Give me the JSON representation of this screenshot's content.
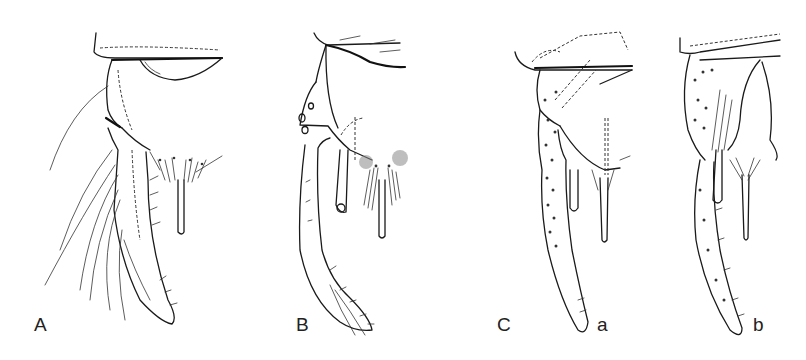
{
  "figure": {
    "panels": [
      {
        "id": "A",
        "label": "A"
      },
      {
        "id": "B",
        "label": "B"
      },
      {
        "id": "C",
        "label": "C",
        "subpanels": [
          {
            "id": "a",
            "label": "a"
          },
          {
            "id": "b",
            "label": "b"
          }
        ]
      }
    ],
    "colors": {
      "ink": "#1a1a1a",
      "background": "#ffffff"
    }
  }
}
